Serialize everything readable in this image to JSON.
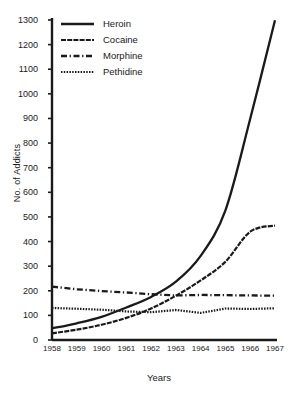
{
  "chart_data": {
    "type": "line",
    "title": "",
    "xlabel": "Years",
    "ylabel": "No. of Addicts",
    "x": [
      1958,
      1959,
      1960,
      1961,
      1962,
      1963,
      1964,
      1965,
      1966,
      1967
    ],
    "xtick_labels": [
      "1958",
      "1959",
      "1960",
      "1961",
      "1962",
      "1963",
      "1964",
      "1965",
      "1966",
      "1967"
    ],
    "ytick_labels": [
      "0",
      "100",
      "200",
      "300",
      "400",
      "500",
      "600",
      "700",
      "800",
      "900",
      "1000",
      "1100",
      "1200",
      "1300"
    ],
    "ylim": [
      0,
      1300
    ],
    "ytick_step": 100,
    "grid": false,
    "legend_position": "top-left",
    "series": [
      {
        "name": "Heroin",
        "style": "solid",
        "values": [
          47,
          68,
          94,
          132,
          175,
          237,
          342,
          527,
          899,
          1299
        ]
      },
      {
        "name": "Cocaine",
        "style": "wavy-thin",
        "values": [
          27,
          42,
          62,
          90,
          128,
          180,
          242,
          318,
          440,
          465
        ]
      },
      {
        "name": "Morphine",
        "style": "dash-dot",
        "values": [
          217,
          206,
          199,
          193,
          186,
          181,
          183,
          182,
          181,
          180
        ]
      },
      {
        "name": "Pethidine",
        "style": "dotted",
        "values": [
          130,
          127,
          123,
          116,
          113,
          122,
          110,
          128,
          126,
          129
        ]
      }
    ]
  },
  "legend": {
    "items": [
      {
        "label": "Heroin",
        "style": "solid"
      },
      {
        "label": "Cocaine",
        "style": "wavy-thin"
      },
      {
        "label": "Morphine",
        "style": "dash-dot"
      },
      {
        "label": "Pethidine",
        "style": "dotted"
      }
    ]
  },
  "colors": {
    "ink": "#1a1a1a",
    "background": "#ffffff"
  }
}
